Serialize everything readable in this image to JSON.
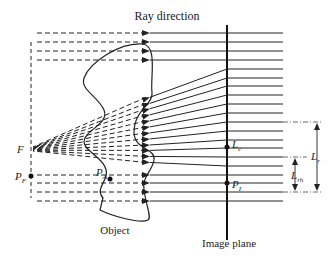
{
  "title": "Ray direction",
  "labels": {
    "ray_direction": "Ray direction",
    "object": "Object",
    "image_plane": "Image plane",
    "focal_point": "F",
    "p_f": "P",
    "p_f_sub": "F",
    "p_a": "P",
    "p_a_sub": "A",
    "p_i": "P",
    "p_i_sub": "I",
    "l_c": "L",
    "l_c_sub": "c",
    "l_r": "L",
    "l_r_sub": "r",
    "l_rh": "L",
    "l_rh_sub": "rh"
  },
  "geometry": {
    "image_plane_x": 181,
    "ray_start_x": 283,
    "arrowhead_x": 150,
    "focal_x": 31,
    "focal_y": 149,
    "left_dashed_x": 31,
    "ray_ys": [
      33,
      42,
      51,
      60,
      69,
      78,
      86,
      95,
      104,
      113,
      122,
      131,
      140,
      148,
      157,
      166,
      175,
      183,
      192,
      201
    ],
    "converging_ray_indices": [
      4,
      5,
      6,
      7,
      8,
      9,
      10,
      11,
      12,
      13,
      14,
      15
    ]
  },
  "colors": {
    "line": "#222222",
    "dim_line": "#444444"
  }
}
